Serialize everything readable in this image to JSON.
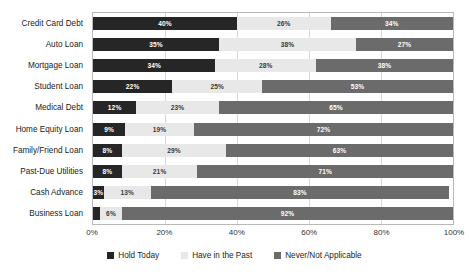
{
  "chart_data": {
    "type": "bar",
    "subtype": "horizontal-stacked-100",
    "title": "",
    "xlabel": "",
    "ylabel": "",
    "xlim": [
      0,
      100
    ],
    "xticks": [
      "0%",
      "20%",
      "40%",
      "60%",
      "80%",
      "100%"
    ],
    "xtick_values": [
      0,
      20,
      40,
      60,
      80,
      100
    ],
    "grid": true,
    "grid_axis": "x",
    "legend_position": "bottom",
    "categories": [
      "Credit Card Debt",
      "Auto Loan",
      "Mortgage Loan",
      "Student Loan",
      "Medical Debt",
      "Home Equity Loan",
      "Family/Friend Loan",
      "Past-Due Utilities",
      "Cash Advance",
      "Business Loan"
    ],
    "series": [
      {
        "name": "Hold Today",
        "color": "#262626",
        "values": [
          40,
          35,
          34,
          22,
          12,
          9,
          8,
          8,
          3,
          2
        ],
        "labels": [
          "40%",
          "35%",
          "34%",
          "22%",
          "12%",
          "9%",
          "8%",
          "8%",
          "3%",
          ""
        ]
      },
      {
        "name": "Have in the Past",
        "color": "#e8e8e8",
        "values": [
          26,
          38,
          28,
          25,
          23,
          19,
          29,
          21,
          13,
          6
        ],
        "labels": [
          "26%",
          "38%",
          "28%",
          "25%",
          "23%",
          "19%",
          "29%",
          "21%",
          "13%",
          "6%"
        ]
      },
      {
        "name": "Never/Not Applicable",
        "color": "#6b6b6b",
        "values": [
          34,
          27,
          38,
          53,
          65,
          72,
          63,
          71,
          83,
          92
        ],
        "labels": [
          "34%",
          "27%",
          "38%",
          "53%",
          "65%",
          "72%",
          "63%",
          "71%",
          "83%",
          "92%"
        ]
      }
    ]
  },
  "legend": {
    "items": [
      {
        "label": "Hold Today",
        "color": "#262626"
      },
      {
        "label": "Have in the Past",
        "color": "#e8e8e8"
      },
      {
        "label": "Never/Not Applicable",
        "color": "#6b6b6b"
      }
    ]
  }
}
